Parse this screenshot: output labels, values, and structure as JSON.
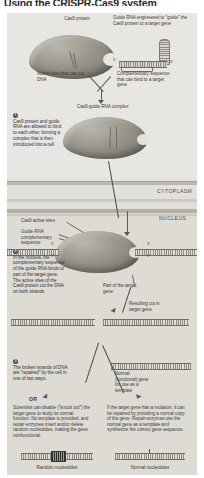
{
  "title": "Using the CRISPR-Cas9 system",
  "figure": {
    "labels": {
      "cas9_protein": "Cas9 protein",
      "guide_rna_engineered": "Guide RNA engineered to \"guide\" the Cas9 protein to a target gene",
      "active_sites": "Active sites that can cut DNA",
      "complementary_seq": "Complementary sequence that can bind to a target gene",
      "complex": "Cas9-guide RNA complex",
      "cytoplasm": "CYTOPLASM",
      "nucleus": "NUCLEUS",
      "cas9_active_sites": "Cas9 active sites",
      "guide_rna_comp_seq": "Guide RNA complementary sequence",
      "part_of_target_gene": "Part of the target gene",
      "resulting_cut": "Resulting cut in target gene",
      "normal_gene_template": "Normal (functional) gene for use as a template",
      "or": "OR",
      "random_nucleotides": "Random nucleotides",
      "normal_nucleotides": "Normal nucleotides",
      "five_prime": "5'",
      "three_prime": "3'"
    },
    "steps": [
      {
        "number": "1",
        "text": "Cas9 protein and guide RNA are allowed to bind to each other, forming a complex that is then introduced into a cell."
      },
      {
        "number": "2",
        "text": "In the nucleus, the complementary sequence of the guide RNA binds to part of the target gene. The active sites of the Cas9 protein cut the DNA on both strands."
      },
      {
        "number": "3",
        "text": "The broken strands of DNA are \"repaired\" by the cell in one of two ways."
      }
    ],
    "outcomes": [
      {
        "name": "knockout",
        "text": "Scientists can disable (\"knock out\") the target gene to study its normal function. No template is provided, and repair enzymes insert and/or delete random nucleotides, making the gene nonfunctional."
      },
      {
        "name": "repair",
        "text": "If the target gene has a mutation, it can be repaired by providing a normal copy of the gene. Repair enzymes use the normal gene as a template and synthesize the correct gene sequence."
      }
    ]
  }
}
